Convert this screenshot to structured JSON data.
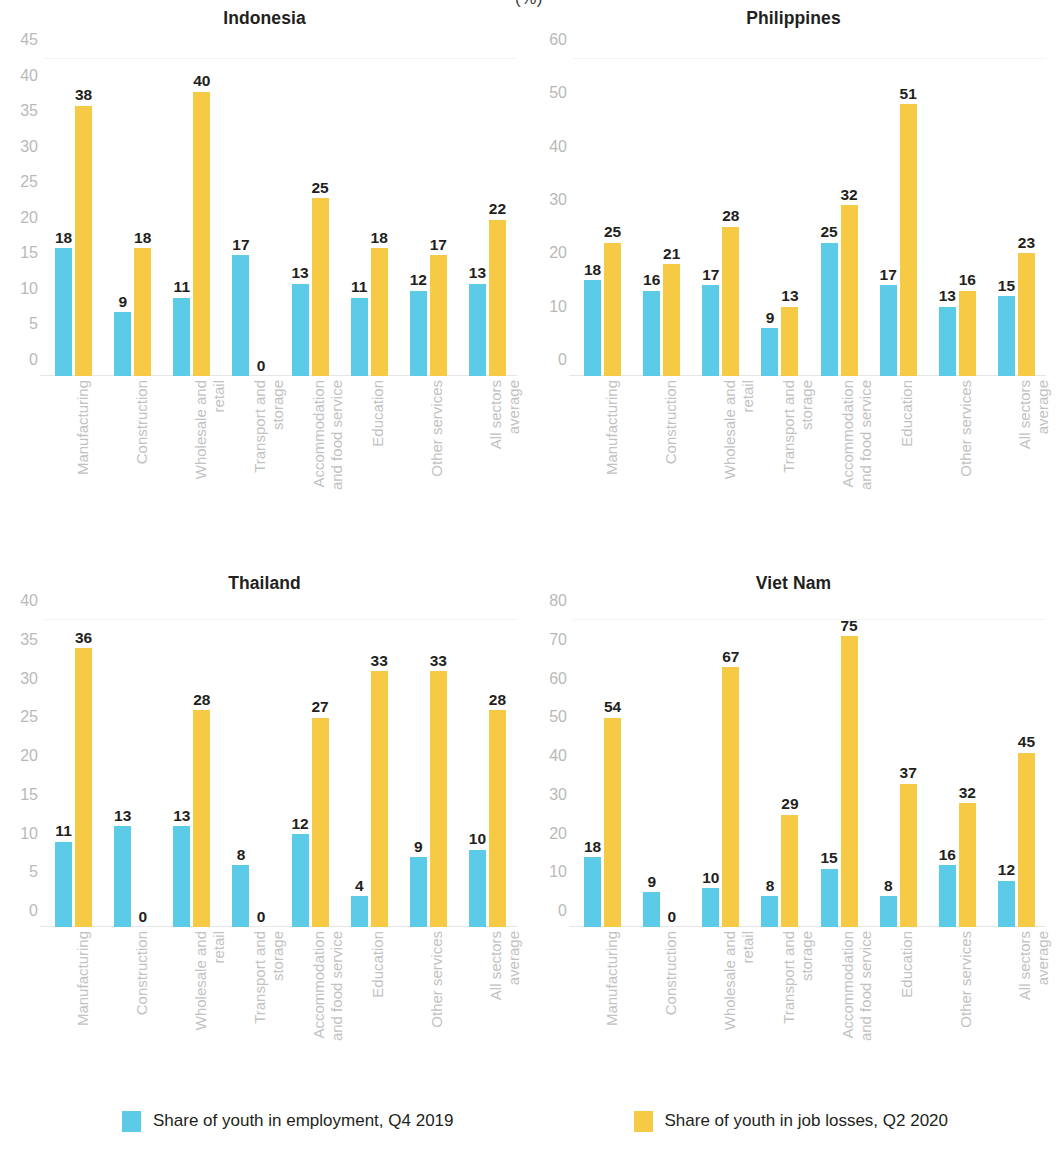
{
  "unit_note": "(%)",
  "legend": {
    "items": [
      {
        "label": "Share of youth in employment, Q4 2019",
        "color": "#5CCBE8",
        "key": "employment_q4_2019"
      },
      {
        "label": "Share of youth in job losses, Q2 2020",
        "color": "#F7CA46",
        "key": "job_losses_q2_2020"
      }
    ]
  },
  "panels": [
    {
      "title": "Indonesia"
    },
    {
      "title": "Philippines"
    },
    {
      "title": "Thailand"
    },
    {
      "title": "Viet Nam"
    }
  ],
  "chart_data": [
    {
      "type": "bar",
      "title": "Indonesia",
      "xlabel": "",
      "ylabel": "",
      "ylim": [
        0,
        45
      ],
      "yticks": [
        0,
        5,
        10,
        15,
        20,
        25,
        30,
        35,
        40,
        45
      ],
      "grid": false,
      "legend_position": "bottom",
      "categories": [
        "Manufacturing",
        "Construction",
        "Wholesale and retail",
        "Transport and storage",
        "Accommodation and food service",
        "Education",
        "Other services",
        "All sectors average"
      ],
      "series": [
        {
          "name": "Share of youth in employment, Q4 2019",
          "color": "#5CCBE8",
          "values": [
            18,
            9,
            11,
            17,
            13,
            11,
            12,
            13
          ]
        },
        {
          "name": "Share of youth in job losses, Q2 2020",
          "color": "#F7CA46",
          "values": [
            38,
            18,
            40,
            0,
            25,
            18,
            17,
            22
          ]
        }
      ]
    },
    {
      "type": "bar",
      "title": "Philippines",
      "xlabel": "",
      "ylabel": "",
      "ylim": [
        0,
        60
      ],
      "yticks": [
        0,
        10,
        20,
        30,
        40,
        50,
        60
      ],
      "grid": false,
      "legend_position": "bottom",
      "categories": [
        "Manufacturing",
        "Construction",
        "Wholesale and retail",
        "Transport and storage",
        "Accommodation and food service",
        "Education",
        "Other services",
        "All sectors average"
      ],
      "series": [
        {
          "name": "Share of youth in employment, Q4 2019",
          "color": "#5CCBE8",
          "values": [
            18,
            16,
            17,
            9,
            25,
            17,
            13,
            15
          ]
        },
        {
          "name": "Share of youth in job losses, Q2 2020",
          "color": "#F7CA46",
          "values": [
            25,
            21,
            28,
            13,
            32,
            51,
            16,
            23
          ]
        }
      ]
    },
    {
      "type": "bar",
      "title": "Thailand",
      "xlabel": "",
      "ylabel": "",
      "ylim": [
        0,
        40
      ],
      "yticks": [
        0,
        5,
        10,
        15,
        20,
        25,
        30,
        35,
        40
      ],
      "grid": false,
      "legend_position": "bottom",
      "categories": [
        "Manufacturing",
        "Construction",
        "Wholesale and retail",
        "Transport and storage",
        "Accommodation and food service",
        "Education",
        "Other services",
        "All sectors average"
      ],
      "series": [
        {
          "name": "Share of youth in employment, Q4 2019",
          "color": "#5CCBE8",
          "values": [
            11,
            13,
            13,
            8,
            12,
            4,
            9,
            10
          ]
        },
        {
          "name": "Share of youth in job losses, Q2 2020",
          "color": "#F7CA46",
          "values": [
            36,
            0,
            28,
            0,
            27,
            33,
            33,
            28
          ]
        }
      ]
    },
    {
      "type": "bar",
      "title": "Viet Nam",
      "xlabel": "",
      "ylabel": "",
      "ylim": [
        0,
        80
      ],
      "yticks": [
        0,
        10,
        20,
        30,
        40,
        50,
        60,
        70,
        80
      ],
      "grid": false,
      "legend_position": "bottom",
      "categories": [
        "Manufacturing",
        "Construction",
        "Wholesale and retail",
        "Transport and storage",
        "Accommodation and food service",
        "Education",
        "Other services",
        "All sectors average"
      ],
      "series": [
        {
          "name": "Share of youth in employment, Q4 2019",
          "color": "#5CCBE8",
          "values": [
            18,
            9,
            10,
            8,
            15,
            8,
            16,
            12
          ]
        },
        {
          "name": "Share of youth in job losses, Q2 2020",
          "color": "#F7CA46",
          "values": [
            54,
            0,
            67,
            29,
            75,
            37,
            32,
            45
          ]
        }
      ]
    }
  ],
  "category_label_lines": [
    [
      "Manufacturing"
    ],
    [
      "Construction"
    ],
    [
      "Wholesale and",
      "retail"
    ],
    [
      "Transport  and",
      "storage"
    ],
    [
      "Accommodation",
      "and food service"
    ],
    [
      "Education"
    ],
    [
      "Other services"
    ],
    [
      "All sectors",
      "average"
    ]
  ]
}
